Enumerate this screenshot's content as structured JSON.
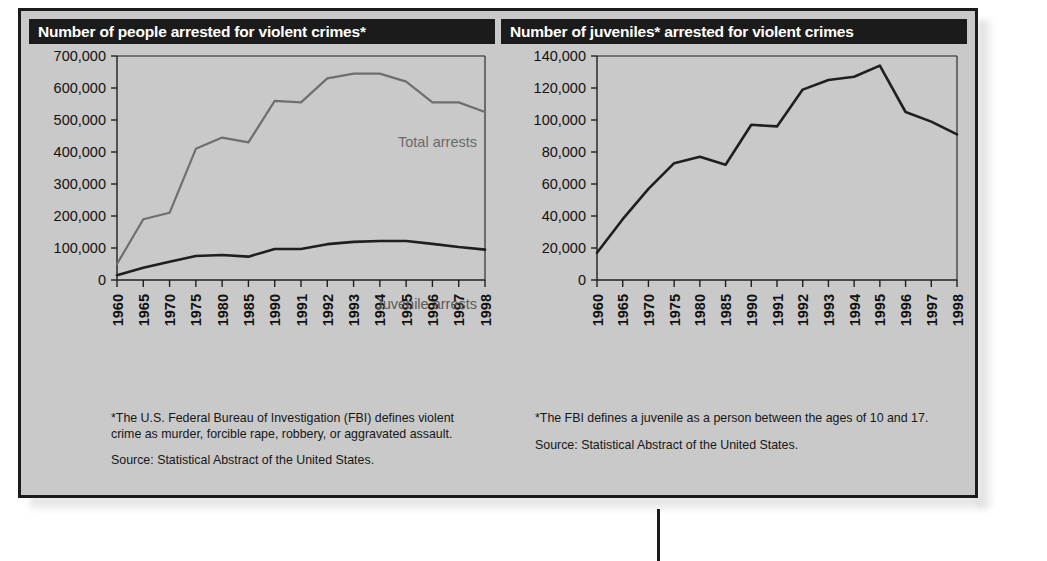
{
  "figure": {
    "accent_dark": "#1b1b1b",
    "panel_bg": "#c9c9c9",
    "total_line_color": "#6f6f6f",
    "juvenile_line_color": "#1f1f1f"
  },
  "panels": [
    {
      "id": "left",
      "title": "Number of people arrested for violent crimes*",
      "notes": [
        "*The U.S. Federal Bureau of Investigation (FBI) defines violent crime as murder, forcible rape, robbery, or aggravated assault.",
        "Source: Statistical Abstract of the United States."
      ],
      "series_labels": {
        "total": "Total arrests",
        "juvenile": "Juvenile arrests"
      }
    },
    {
      "id": "right",
      "title": "Number of juveniles* arrested for violent crimes",
      "notes": [
        "*The FBI defines a juvenile as a person between the ages of 10 and 17.",
        "Source: Statistical Abstract of the United States."
      ],
      "series_labels": {}
    }
  ],
  "chart_data": [
    {
      "type": "line",
      "title": "Number of people arrested for violent crimes*",
      "xlabel": "",
      "ylabel": "",
      "ylim": [
        0,
        700000
      ],
      "yticks": [
        0,
        100000,
        200000,
        300000,
        400000,
        500000,
        600000,
        700000
      ],
      "ytick_labels": [
        "0",
        "100,000",
        "200,000",
        "300,000",
        "400,000",
        "500,000",
        "600,000",
        "700,000"
      ],
      "grid": false,
      "legend": "inline-labels",
      "categories": [
        "1960",
        "1965",
        "1970",
        "1975",
        "1980",
        "1985",
        "1990",
        "1991",
        "1992",
        "1993",
        "1994",
        "1995",
        "1996",
        "1997",
        "1998"
      ],
      "series": [
        {
          "name": "Total arrests",
          "color": "#6f6f6f",
          "values": [
            50000,
            190000,
            210000,
            410000,
            445000,
            430000,
            560000,
            555000,
            630000,
            645000,
            645000,
            620000,
            555000,
            555000,
            525000
          ]
        },
        {
          "name": "Juvenile arrests",
          "color": "#1f1f1f",
          "values": [
            15000,
            38000,
            57000,
            75000,
            78000,
            73000,
            97000,
            97000,
            112000,
            119000,
            122000,
            122000,
            113000,
            103000,
            95000
          ]
        }
      ]
    },
    {
      "type": "line",
      "title": "Number of juveniles* arrested for violent crimes",
      "xlabel": "",
      "ylabel": "",
      "ylim": [
        0,
        140000
      ],
      "yticks": [
        0,
        20000,
        40000,
        60000,
        80000,
        100000,
        120000,
        140000
      ],
      "ytick_labels": [
        "0",
        "20,000",
        "40,000",
        "60,000",
        "80,000",
        "100,000",
        "120,000",
        "140,000"
      ],
      "grid": false,
      "legend": "none",
      "categories": [
        "1960",
        "1965",
        "1970",
        "1975",
        "1980",
        "1985",
        "1990",
        "1991",
        "1992",
        "1993",
        "1994",
        "1995",
        "1996",
        "1997",
        "1998"
      ],
      "series": [
        {
          "name": "Juveniles arrested",
          "color": "#1f1f1f",
          "values": [
            17000,
            38000,
            57000,
            73000,
            77000,
            72000,
            97000,
            96000,
            119000,
            125000,
            127000,
            134000,
            105000,
            99000,
            91000
          ]
        }
      ]
    }
  ]
}
